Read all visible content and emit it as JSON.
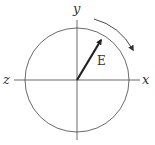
{
  "diagram": {
    "title": "",
    "labels": {
      "x_axis": "x",
      "y_axis": "y",
      "z_axis": "z",
      "vector": "E"
    },
    "circle": {
      "cx": 77,
      "cy": 80,
      "r": 52
    },
    "vector_E": {
      "from": [
        77,
        80
      ],
      "to": [
        101,
        40
      ]
    },
    "rotation": {
      "direction": "clockwise"
    },
    "colors": {
      "line": "#333333",
      "vector": "#222222"
    }
  }
}
